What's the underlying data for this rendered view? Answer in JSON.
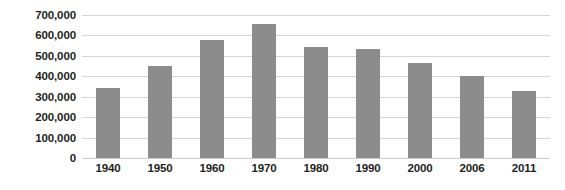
{
  "chart_data": {
    "type": "bar",
    "title": "",
    "subtitle": "",
    "xlabel": "",
    "ylabel": "",
    "categories": [
      "1940",
      "1950",
      "1960",
      "1970",
      "1980",
      "1990",
      "2000",
      "2006",
      "2011"
    ],
    "values": [
      342000,
      450000,
      580000,
      655000,
      545000,
      535000,
      465000,
      400000,
      328000
    ],
    "series": [
      {
        "name": "",
        "values": [
          342000,
          450000,
          580000,
          655000,
          545000,
          535000,
          465000,
          400000,
          328000
        ]
      }
    ],
    "ylim": [
      0,
      700000
    ],
    "ytick_step": 100000,
    "ytick_labels": [
      "700,000",
      "600,000",
      "500,000",
      "400,000",
      "300,000",
      "200,000",
      "100,000",
      "0"
    ],
    "ytick_values": [
      700000,
      600000,
      500000,
      400000,
      300000,
      200000,
      100000,
      0
    ],
    "grid": true,
    "grid_axis": "y",
    "legend": false,
    "legend_position": "none",
    "annotations": [],
    "colors": {
      "bar_fill": "#8c8c8c",
      "gridline": "#d4d4d4",
      "baseline": "#c8c8c8",
      "tick_label": "#231f20",
      "background": "#ffffff"
    }
  }
}
